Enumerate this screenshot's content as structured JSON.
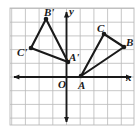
{
  "figure": {
    "background_color": "#ffffff",
    "grid": {
      "visible": true,
      "color": "#b9b9b9",
      "spacing_px": 13.7,
      "left_px": 10,
      "top_px": 8,
      "right_px": 134,
      "bottom_px": 125,
      "columns": 9,
      "rows": 8.5
    },
    "axes": {
      "color": "#1a1a1a",
      "origin_px": {
        "x": 66.5,
        "y": 77
      },
      "x_axis": {
        "label": "x",
        "label_px": {
          "x": 127,
          "y": 73
        },
        "start_px": {
          "x": 12,
          "y": 77
        },
        "end_px": {
          "x": 133,
          "y": 77
        },
        "arrows": "both"
      },
      "y_axis": {
        "label": "y",
        "label_px": {
          "x": 69,
          "y": 7
        },
        "start_px": {
          "x": 66.5,
          "y": 10
        },
        "end_px": {
          "x": 66.5,
          "y": 124
        },
        "arrows": "both"
      },
      "origin_label": "O",
      "origin_label_px": {
        "x": 58,
        "y": 80
      }
    },
    "shapes": [
      {
        "name": "triangle-abc",
        "stroke": "#1a1a1a",
        "vertices": [
          {
            "label": "A",
            "px": {
              "x": 81,
              "y": 76
            },
            "grid": {
              "x": 1,
              "y": 0
            },
            "label_px": {
              "x": 78,
              "y": 80
            },
            "dot": true
          },
          {
            "label": "B",
            "px": {
              "x": 124,
              "y": 47
            },
            "grid": {
              "x": 4,
              "y": 2
            },
            "label_px": {
              "x": 126,
              "y": 37
            },
            "dot": true
          },
          {
            "label": "C",
            "px": {
              "x": 104,
              "y": 34
            },
            "grid": {
              "x": 3,
              "y": 3
            },
            "label_px": {
              "x": 97,
              "y": 23
            },
            "dot": true
          }
        ]
      },
      {
        "name": "triangle-a-prime-b-prime-c-prime",
        "stroke": "#1a1a1a",
        "vertices": [
          {
            "label": "A'",
            "px": {
              "x": 68,
              "y": 62
            },
            "grid": {
              "x": 0,
              "y": 1
            },
            "label_px": {
              "x": 69,
              "y": 52
            },
            "dot": true
          },
          {
            "label": "B'",
            "px": {
              "x": 46,
              "y": 19
            },
            "grid": {
              "x": -2,
              "y": 4
            },
            "label_px": {
              "x": 44,
              "y": 8
            },
            "dot": true
          },
          {
            "label": "C'",
            "px": {
              "x": 31,
              "y": 48
            },
            "grid": {
              "x": -3,
              "y": 2
            },
            "label_px": {
              "x": 18,
              "y": 48
            },
            "dot": true
          }
        ]
      }
    ]
  },
  "chart_data": {
    "type": "scatter",
    "xlabel": "x",
    "ylabel": "y",
    "xlim": [
      -4,
      5
    ],
    "ylim": [
      -3.5,
      5
    ],
    "grid": true,
    "legend": "none",
    "series": [
      {
        "name": "Triangle ABC",
        "closed": true,
        "points": [
          {
            "label": "A",
            "x": 1,
            "y": 0
          },
          {
            "label": "B",
            "x": 4,
            "y": 2
          },
          {
            "label": "C",
            "x": 3,
            "y": 3
          }
        ]
      },
      {
        "name": "Triangle A'B'C'",
        "closed": true,
        "points": [
          {
            "label": "A'",
            "x": 0,
            "y": 1
          },
          {
            "label": "B'",
            "x": -2,
            "y": 4
          },
          {
            "label": "C'",
            "x": -3,
            "y": 2
          }
        ]
      }
    ],
    "annotations": [
      "O",
      "x",
      "y"
    ]
  }
}
